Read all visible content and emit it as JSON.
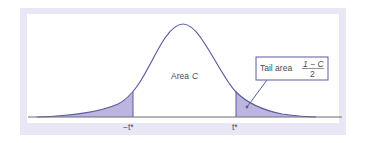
{
  "diagram": {
    "center_label": "Area",
    "center_symbol": "C",
    "left_tick_label": "−t*",
    "right_tick_label": "t*",
    "callout": {
      "text": "Tail area",
      "fraction_numerator": "1 − C",
      "fraction_denominator": "2"
    },
    "colors": {
      "frame": "#e9e6f5",
      "panel": "#ffffff",
      "curve": "#5a5c9e",
      "shade": "#bdb5e0",
      "axis": "#6a6a7a",
      "callout_border": "#5a5c9e",
      "text": "#4a4a5a"
    }
  }
}
